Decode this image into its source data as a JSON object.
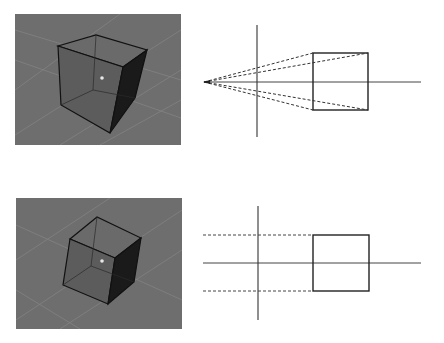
{
  "figure": {
    "colors": {
      "background": "#ffffff",
      "viewport_bg": "#6e6e6e",
      "grid_line": "#858585",
      "cube_face_front": "#5e5e5e",
      "cube_face_top": "#6a6a6a",
      "cube_face_right": "#1a1a1a",
      "cube_edge": "#111111",
      "line": "#333333",
      "dashed": "#444444"
    },
    "panels": [
      {
        "id": "perspective",
        "label": "perspective-view",
        "viewport": {
          "x": 15,
          "y": 14,
          "w": 166,
          "h": 131
        }
      },
      {
        "id": "orthographic",
        "label": "orthographic-view",
        "viewport": {
          "x": 16,
          "y": 198,
          "w": 166,
          "h": 131
        }
      }
    ]
  }
}
